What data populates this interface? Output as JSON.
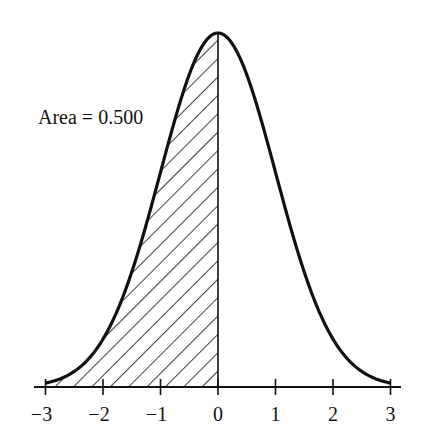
{
  "chart_data": {
    "type": "area",
    "title": "",
    "xlabel": "",
    "ylabel": "",
    "x_ticks": [
      -3,
      -2,
      -1,
      0,
      1,
      2,
      3
    ],
    "x_tick_labels": [
      "−3",
      "−2",
      "−1",
      "0",
      "1",
      "2",
      "3"
    ],
    "xlim": [
      -3.2,
      3.2
    ],
    "grid": false,
    "legend": null,
    "series": [
      {
        "name": "Standard normal density",
        "function": "phi(z) = exp(-z^2/2)/sqrt(2*pi)",
        "x": [
          -3,
          -2.5,
          -2,
          -1.5,
          -1,
          -0.5,
          0,
          0.5,
          1,
          1.5,
          2,
          2.5,
          3
        ],
        "y": [
          0.0044,
          0.0175,
          0.054,
          0.1295,
          0.242,
          0.3521,
          0.3989,
          0.3521,
          0.242,
          0.1295,
          0.054,
          0.0175,
          0.0044
        ]
      }
    ],
    "shaded_region": {
      "from": -3,
      "to": 0,
      "pattern": "diagonal-hatch",
      "area": 0.5
    },
    "annotations": [
      {
        "text": "Area = 0.500",
        "target": "shaded_region"
      }
    ]
  },
  "annotation": {
    "area_label": "Area = 0.500"
  },
  "axis": {
    "ticks": [
      {
        "value": -3,
        "label": "−3"
      },
      {
        "value": -2,
        "label": "−2"
      },
      {
        "value": -1,
        "label": "−1"
      },
      {
        "value": 0,
        "label": "0"
      },
      {
        "value": 1,
        "label": "1"
      },
      {
        "value": 2,
        "label": "2"
      },
      {
        "value": 3,
        "label": "3"
      }
    ]
  },
  "colors": {
    "ink": "#111111",
    "background": "#ffffff"
  }
}
